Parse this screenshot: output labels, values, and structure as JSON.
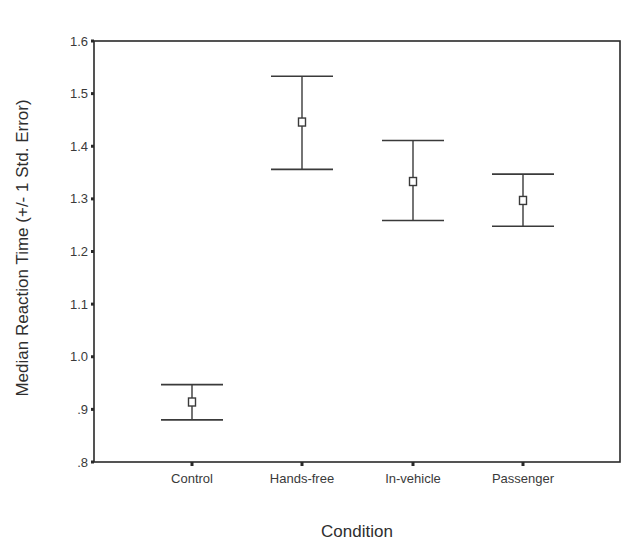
{
  "chart_data": {
    "type": "errorbar",
    "title": "",
    "xlabel": "Condition",
    "ylabel": "Median Reaction Time (+/- 1 Std. Error)",
    "categories": [
      "Control",
      "Hands-free",
      "In-vehicle",
      "Passenger"
    ],
    "values": [
      0.914,
      1.446,
      1.333,
      1.297
    ],
    "error_upper": [
      0.947,
      1.533,
      1.411,
      1.347
    ],
    "error_lower": [
      0.88,
      1.356,
      1.259,
      1.248
    ],
    "ylim": [
      0.8,
      1.6
    ],
    "yticks": [
      0.8,
      0.9,
      1.0,
      1.1,
      1.2,
      1.3,
      1.4,
      1.5,
      1.6
    ],
    "ytick_labels": [
      ".8",
      ".9",
      "1.0",
      "1.1",
      "1.2",
      "1.3",
      "1.4",
      "1.5",
      "1.6"
    ],
    "grid": false,
    "legend": null,
    "marker": "hollow-square"
  },
  "colors": {
    "axis": "#2a2a2a",
    "bars": "#3a3a3a",
    "background": "#ffffff"
  }
}
